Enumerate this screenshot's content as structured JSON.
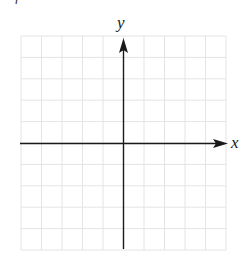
{
  "diagram": {
    "type": "cartesian-grid",
    "x_axis_label": "x",
    "y_axis_label": "y",
    "corner_fragment": "ƒ",
    "grid": {
      "columns": 10,
      "rows": 10,
      "left": 21,
      "top": 36,
      "right": 226,
      "bottom": 250
    },
    "origin": {
      "x": 123.5,
      "y": 143.5
    },
    "colors": {
      "grid_line": "#e4e4e4",
      "axis": "#1a1a1a",
      "background": "#ffffff"
    }
  },
  "chart_data": {
    "type": "scatter",
    "title": "",
    "xlabel": "x",
    "ylabel": "y",
    "x": [],
    "y": [],
    "grid": true,
    "xlim": [
      -5,
      5
    ],
    "ylim": [
      -5,
      5
    ],
    "legend": null
  }
}
